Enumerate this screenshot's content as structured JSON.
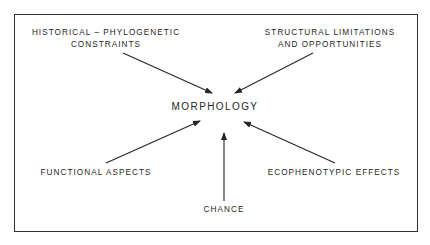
{
  "diagram": {
    "central_node": "MORPHOLOGY",
    "factors": [
      {
        "id": "historical",
        "lines": [
          "HISTORICAL – PHYLOGENETIC",
          "CONSTRAINTS"
        ],
        "position": "top-left"
      },
      {
        "id": "structural",
        "lines": [
          "STRUCTURAL  LIMITATIONS",
          "AND  OPPORTUNITIES"
        ],
        "position": "top-right"
      },
      {
        "id": "functional",
        "lines": [
          "FUNCTIONAL  ASPECTS"
        ],
        "position": "bottom-left"
      },
      {
        "id": "ecophenotypic",
        "lines": [
          "ECOPHENOTYPIC  EFFECTS"
        ],
        "position": "bottom-right"
      },
      {
        "id": "chance",
        "lines": [
          "CHANCE"
        ],
        "position": "bottom-center"
      }
    ],
    "arrows": [
      {
        "from": "historical",
        "to": "MORPHOLOGY",
        "x1": 123,
        "y1": 53,
        "x2": 212,
        "y2": 93
      },
      {
        "from": "structural",
        "to": "MORPHOLOGY",
        "x1": 313,
        "y1": 53,
        "x2": 235,
        "y2": 93
      },
      {
        "from": "functional",
        "to": "MORPHOLOGY",
        "x1": 106,
        "y1": 163,
        "x2": 200,
        "y2": 121
      },
      {
        "from": "ecophenotypic",
        "to": "MORPHOLOGY",
        "x1": 335,
        "y1": 163,
        "x2": 244,
        "y2": 122
      },
      {
        "from": "chance",
        "to": "MORPHOLOGY",
        "x1": 224,
        "y1": 201,
        "x2": 224,
        "y2": 133
      }
    ],
    "colors": {
      "ink": "#262626",
      "background": "#ffffff"
    }
  }
}
